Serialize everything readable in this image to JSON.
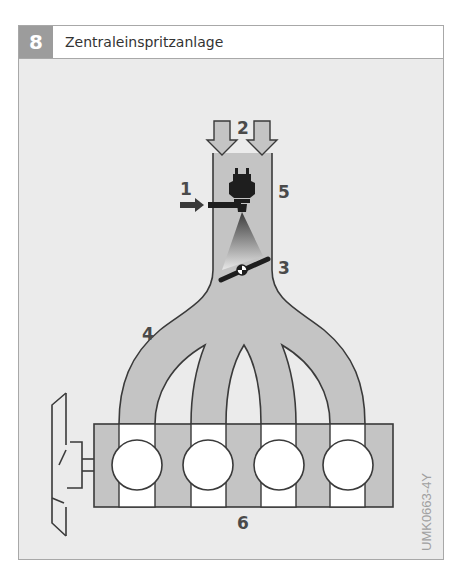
{
  "figure": {
    "number": "8",
    "title": "Zentraleinspritzanlage",
    "code": "UMK0663-4Y"
  },
  "labels": [
    {
      "id": "1",
      "text": "1",
      "meaning": "fuel supply"
    },
    {
      "id": "2",
      "text": "2",
      "meaning": "air intake"
    },
    {
      "id": "3",
      "text": "3",
      "meaning": "throttle valve"
    },
    {
      "id": "4",
      "text": "4",
      "meaning": "intake manifold"
    },
    {
      "id": "5",
      "text": "5",
      "meaning": "injector"
    },
    {
      "id": "6",
      "text": "6",
      "meaning": "engine"
    }
  ],
  "colors": {
    "background": "#ebebeb",
    "manifold_fill": "#c4c4c4",
    "outline": "#3a3a3a",
    "badge": "#9c9c9c",
    "cylinder": "#ffffff"
  },
  "cylinders": 4
}
